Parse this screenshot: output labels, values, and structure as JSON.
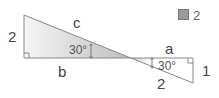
{
  "diagram": {
    "badge": {
      "icon": "calculator-icon",
      "number": "2"
    },
    "left_triangle": {
      "height_label": "2",
      "base_label": "b",
      "hypotenuse_label": "c",
      "angle_label": "30°"
    },
    "right_triangle": {
      "base_label": "a",
      "height_label": "1",
      "hypotenuse_label": "2",
      "angle_label": "30°"
    },
    "colors": {
      "line": "#888888",
      "fill_light": "#f4f4f4",
      "fill_dark": "#bdbdbd"
    }
  }
}
